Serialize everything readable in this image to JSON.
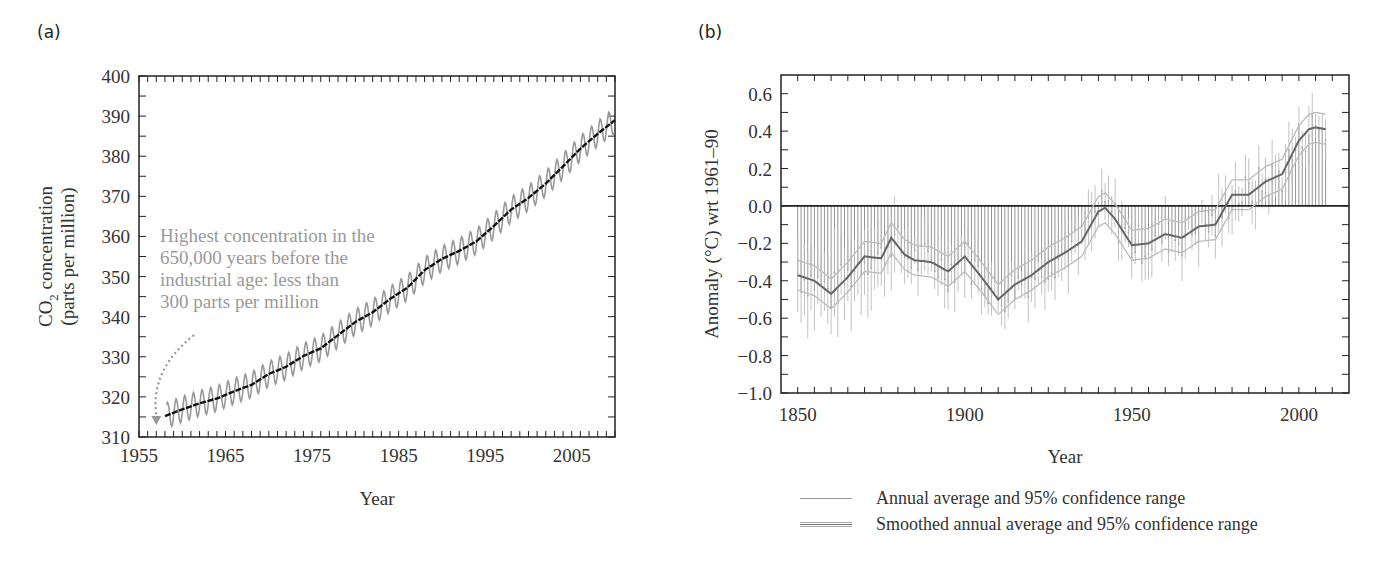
{
  "panels": {
    "a": {
      "label": "(a)"
    },
    "b": {
      "label": "(b)"
    }
  },
  "chart_data": [
    {
      "type": "line",
      "panel": "(a)",
      "title": "",
      "xlabel": "Year",
      "ylabel_line1": "CO2 concentration",
      "ylabel_line2": "(parts per million)",
      "xlim": [
        1955,
        2010
      ],
      "ylim": [
        310,
        400
      ],
      "x_ticks": [
        1955,
        1965,
        1975,
        1985,
        1995,
        2005
      ],
      "y_ticks": [
        310,
        320,
        330,
        340,
        350,
        360,
        370,
        380,
        390,
        400
      ],
      "grid": false,
      "series": [
        {
          "name": "Monthly CO2 (seasonal cycle)",
          "color": "#999999",
          "style": "oscillating",
          "seasonal_amplitude": 3.2
        },
        {
          "name": "Annual mean CO2",
          "color": "#111111",
          "x": [
            1958,
            1960,
            1962,
            1964,
            1966,
            1968,
            1970,
            1972,
            1974,
            1976,
            1978,
            1980,
            1982,
            1984,
            1986,
            1988,
            1990,
            1992,
            1994,
            1996,
            1998,
            2000,
            2002,
            2004,
            2006,
            2008,
            2010
          ],
          "values": [
            315.2,
            316.9,
            318.4,
            319.6,
            321.4,
            323.0,
            325.7,
            327.5,
            330.2,
            332.1,
            335.4,
            338.7,
            341.1,
            344.4,
            347.2,
            351.6,
            354.4,
            356.4,
            358.8,
            362.6,
            366.7,
            369.6,
            373.2,
            377.5,
            381.9,
            385.6,
            389.0
          ]
        }
      ],
      "annotation": {
        "lines": [
          "Highest concentration in the",
          "650,000 years before the",
          "industrial age: less than",
          "300 parts per million"
        ],
        "arrow_to": [
          1957,
          313
        ]
      }
    },
    {
      "type": "line",
      "panel": "(b)",
      "title": "",
      "xlabel": "Year",
      "ylabel": "Anomaly (°C) wrt 1961–90",
      "xlim": [
        1845,
        2015
      ],
      "ylim": [
        -1.0,
        0.7
      ],
      "x_ticks": [
        1850,
        1900,
        1950,
        2000
      ],
      "y_ticks": [
        -1.0,
        -0.8,
        -0.6,
        -0.4,
        -0.2,
        0.0,
        0.2,
        0.4,
        0.6
      ],
      "y_tick_labels": [
        "−1.0",
        "−0.8",
        "−0.6",
        "−0.4",
        "−0.2",
        "0.0",
        "0.2",
        "0.4",
        "0.6"
      ],
      "grid": false,
      "baseline": 0.0,
      "series": [
        {
          "name": "Smoothed annual average",
          "color": "#666666",
          "x": [
            1850,
            1855,
            1860,
            1865,
            1870,
            1875,
            1878,
            1882,
            1885,
            1890,
            1895,
            1900,
            1905,
            1910,
            1915,
            1920,
            1925,
            1930,
            1935,
            1940,
            1942,
            1945,
            1950,
            1955,
            1960,
            1965,
            1970,
            1975,
            1980,
            1985,
            1990,
            1995,
            2000,
            2003,
            2005,
            2008
          ],
          "values": [
            -0.37,
            -0.4,
            -0.47,
            -0.38,
            -0.27,
            -0.28,
            -0.17,
            -0.26,
            -0.29,
            -0.3,
            -0.35,
            -0.27,
            -0.38,
            -0.5,
            -0.42,
            -0.37,
            -0.3,
            -0.25,
            -0.19,
            -0.03,
            -0.01,
            -0.07,
            -0.21,
            -0.2,
            -0.15,
            -0.17,
            -0.11,
            -0.1,
            0.06,
            0.06,
            0.13,
            0.17,
            0.35,
            0.41,
            0.42,
            0.41
          ]
        },
        {
          "name": "Smoothed upper 95% bound",
          "color": "#bbbbbb",
          "offset": 0.08
        },
        {
          "name": "Smoothed lower 95% bound",
          "color": "#bbbbbb",
          "offset": -0.08
        }
      ],
      "legend": {
        "position": "bottom",
        "entries": [
          {
            "label": "Annual average and 95% confidence range",
            "style": "single"
          },
          {
            "label": "Smoothed annual average and 95% confidence range",
            "style": "double"
          }
        ]
      }
    }
  ]
}
